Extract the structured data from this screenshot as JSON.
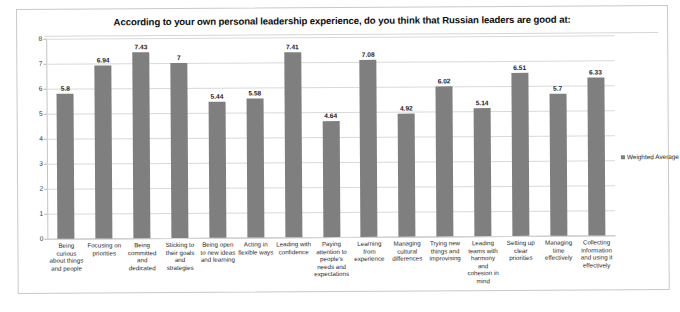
{
  "chart_data": {
    "type": "bar",
    "title": "According to your own personal leadership experience, do you think that Russian leaders are good at:",
    "xlabel": "",
    "ylabel": "",
    "ylim": [
      0,
      8
    ],
    "ytick_step": 1,
    "ytick_labels": [
      "0",
      "1",
      "2",
      "3",
      "4",
      "5",
      "6",
      "7",
      "8"
    ],
    "grid": true,
    "legend_position": "right",
    "series": [
      {
        "name": "Weighted Average",
        "color": "#7f7f7f",
        "values": [
          5.8,
          6.94,
          7.43,
          7,
          5.44,
          5.58,
          7.41,
          4.64,
          7.08,
          4.92,
          6.02,
          5.14,
          6.51,
          5.7,
          6.33
        ]
      }
    ],
    "value_labels": [
      "5.8",
      "6.94",
      "7.43",
      "7",
      "5.44",
      "5.58",
      "7.41",
      "4.64",
      "7.08",
      "4.92",
      "6.02",
      "5.14",
      "6.51",
      "5.7",
      "6.33"
    ],
    "categories": [
      "Being curious about things and people",
      "Focusing on priorities",
      "Being committed and dedicated",
      "Sticking to their goals and strategies",
      "Being open to new ideas and learning",
      "Acting in flexible ways",
      "Leading with confidence",
      "Paying attention to people's needs and expectations",
      "Learning from experience",
      "Managing cultural differences",
      "Trying new things and improvising",
      "Leading teams with harmony and cohesion in mind",
      "Setting up clear priorities",
      "Managing time effectively",
      "Collecting information and using it effectively"
    ]
  },
  "legend": {
    "entries": [
      {
        "label": "Weighted Average",
        "color": "#7f7f7f",
        "marker": "square-swatch"
      }
    ]
  },
  "colors": {
    "bar": "#7f7f7f",
    "gridline": "#d9d9d9",
    "axis": "#a8a8a8",
    "frame": "#c9c9c9",
    "text": "#1a1a1a"
  }
}
